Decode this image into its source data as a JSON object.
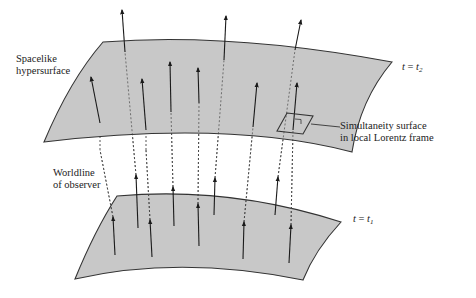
{
  "figure": {
    "type": "spacetime-foliation-diagram",
    "labels": {
      "upper_surface": [
        "Spacelike",
        "hypersurface"
      ],
      "upper_time": {
        "lhs": "t",
        "eq": " = ",
        "rhs": "t",
        "sub": "2"
      },
      "lower_time": {
        "lhs": "t",
        "eq": " = ",
        "rhs": "t",
        "sub": "1"
      },
      "simultaneity": [
        "Simultaneity surface",
        "in local Lorentz frame"
      ],
      "worldline": [
        "Worldline",
        "of observer"
      ]
    },
    "colors": {
      "surface_fill": "#c8c8c8",
      "surface_stroke": "#333333",
      "arrow": "#1a1a1a",
      "dashed": "#444444"
    },
    "surfaces": {
      "upper": "M 103,42 Q 230,32 392,62 Q 360,100 352,152 Q 230,120 44,142 Q 70,80 103,42 Z",
      "lower": "M 117,196 Q 230,186 341,222 Q 315,250 303,280 Q 180,255 75,279 Q 95,230 117,196 Z"
    },
    "lower_arrows": [
      {
        "x1": 115,
        "y1": 255,
        "x2": 113,
        "y2": 217
      },
      {
        "x1": 152,
        "y1": 257,
        "x2": 150,
        "y2": 220
      },
      {
        "x1": 138,
        "y1": 228,
        "x2": 136,
        "y2": 175
      },
      {
        "x1": 174,
        "y1": 226,
        "x2": 173,
        "y2": 187
      },
      {
        "x1": 199,
        "y1": 246,
        "x2": 198,
        "y2": 204
      },
      {
        "x1": 214,
        "y1": 215,
        "x2": 215,
        "y2": 178
      },
      {
        "x1": 243,
        "y1": 259,
        "x2": 244,
        "y2": 222
      },
      {
        "x1": 275,
        "y1": 215,
        "x2": 278,
        "y2": 177
      },
      {
        "x1": 289,
        "y1": 263,
        "x2": 291,
        "y2": 225
      }
    ],
    "upper_arrows": [
      {
        "x1": 100,
        "y1": 123,
        "x2": 91,
        "y2": 77
      },
      {
        "x1": 146,
        "y1": 130,
        "x2": 142,
        "y2": 79
      },
      {
        "x1": 125,
        "y1": 52,
        "x2": 122,
        "y2": 10
      },
      {
        "x1": 171,
        "y1": 112,
        "x2": 170,
        "y2": 62
      },
      {
        "x1": 199,
        "y1": 103,
        "x2": 198,
        "y2": 68
      },
      {
        "x1": 224,
        "y1": 60,
        "x2": 226,
        "y2": 16
      },
      {
        "x1": 253,
        "y1": 127,
        "x2": 257,
        "y2": 83
      },
      {
        "x1": 293,
        "y1": 130,
        "x2": 297,
        "y2": 83
      },
      {
        "x1": 295,
        "y1": 50,
        "x2": 301,
        "y2": 20
      }
    ],
    "dashed_lines": [
      {
        "x1": 113,
        "y1": 217,
        "x2": 100,
        "y2": 150
      },
      {
        "x1": 150,
        "y1": 220,
        "x2": 146,
        "y2": 150
      },
      {
        "x1": 136,
        "y1": 175,
        "x2": 125,
        "y2": 52
      },
      {
        "x1": 173,
        "y1": 187,
        "x2": 171,
        "y2": 112
      },
      {
        "x1": 198,
        "y1": 204,
        "x2": 199,
        "y2": 103
      },
      {
        "x1": 215,
        "y1": 178,
        "x2": 224,
        "y2": 60
      },
      {
        "x1": 244,
        "y1": 222,
        "x2": 253,
        "y2": 127
      },
      {
        "x1": 278,
        "y1": 177,
        "x2": 295,
        "y2": 50
      },
      {
        "x1": 291,
        "y1": 225,
        "x2": 293,
        "y2": 130
      },
      {
        "x1": 100,
        "y1": 150,
        "x2": 100,
        "y2": 123
      },
      {
        "x1": 146,
        "y1": 150,
        "x2": 146,
        "y2": 130
      }
    ],
    "simultaneity_box": "M 287,113 L 313,116 L 303,134 L 277,131 Z",
    "simultaneity_leader": {
      "x1": 311,
      "y1": 124,
      "x2": 340,
      "y2": 127
    }
  }
}
